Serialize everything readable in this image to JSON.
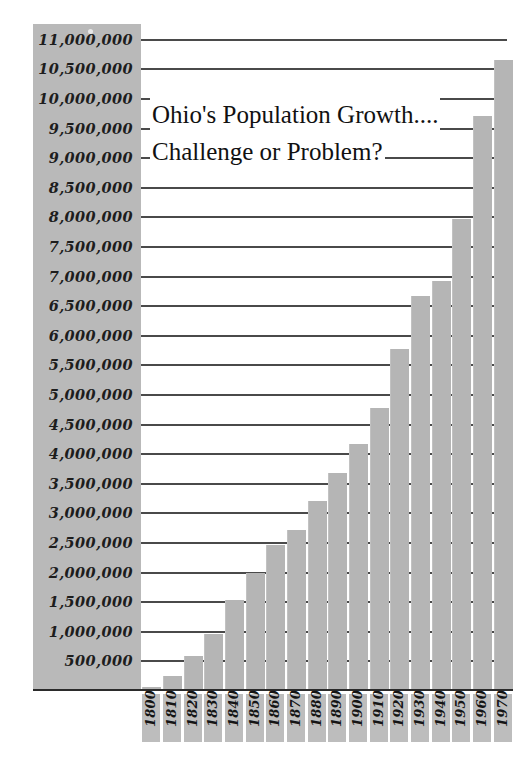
{
  "chart_data": {
    "type": "bar",
    "title": "Ohio's Population Growth....",
    "subtitle": "Challenge or Problem?",
    "xlabel": "",
    "ylabel": "",
    "ylim": [
      0,
      11250000
    ],
    "grid": true,
    "legend": null,
    "categories": [
      "1800",
      "1810",
      "1820",
      "1830",
      "1840",
      "1850",
      "1860",
      "1870",
      "1880",
      "1890",
      "1900",
      "1910",
      "1920",
      "1930",
      "1940",
      "1950",
      "1960",
      "1970"
    ],
    "values": [
      45000,
      230000,
      580000,
      940000,
      1520000,
      1980000,
      2450000,
      2700000,
      3200000,
      3670000,
      4160000,
      4770000,
      5760000,
      6650000,
      6910000,
      7950000,
      9700000,
      10650000
    ],
    "ytick_labels": [
      "11,000,000",
      "10,500,000",
      "10,000,000",
      "9,500,000",
      "9,000,000",
      "8,500,000",
      "8,000,000",
      "7,500,000",
      "7,000,000",
      "6,500,000",
      "6,000,000",
      "5,500,000",
      "5,000,000",
      "4,500,000",
      "4,000,000",
      "3,500,000",
      "3,000,000",
      "2,500,000",
      "2,000,000",
      "1,500,000",
      "1,000,000",
      "500,000"
    ],
    "ytick_values": [
      11000000,
      10500000,
      10000000,
      9500000,
      9000000,
      8500000,
      8000000,
      7500000,
      7000000,
      6500000,
      6000000,
      5500000,
      5000000,
      4500000,
      4000000,
      3500000,
      3000000,
      2500000,
      2000000,
      1500000,
      1000000,
      500000
    ],
    "colors": {
      "bar": "#b5b5b5",
      "gridline": "#4a4a4a",
      "baseline": "#2b2b2b",
      "label_panel": "#b9b9b9",
      "xtick_panel": "#bdbdbd",
      "text": "#151515",
      "background": "#ffffff"
    }
  }
}
